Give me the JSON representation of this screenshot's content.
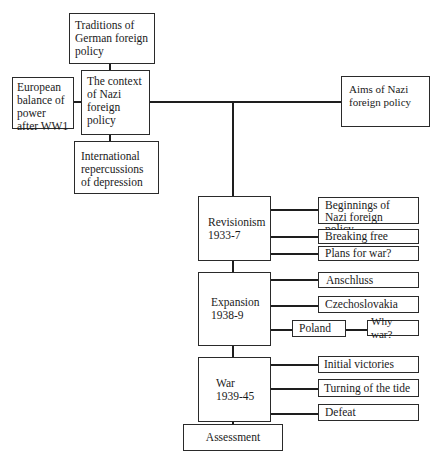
{
  "diagram": {
    "type": "hierarchy-chart",
    "context": {
      "center": "The context of Nazi foreign policy",
      "top": "Traditions of German foreign policy",
      "left": "European balance of power after WW1",
      "bottom": "International repercussions of depression"
    },
    "aims": "Aims of Nazi foreign policy",
    "phases": [
      {
        "title": "Revisionism",
        "years": "1933-7",
        "topics": [
          "Beginnings of Nazi foreign policy",
          "Breaking free",
          "Plans for war?"
        ]
      },
      {
        "title": "Expansion",
        "years": "1938-9",
        "topics": [
          "Anschluss",
          "Czechoslovakia",
          "Poland"
        ],
        "subtopic": "Why war?"
      },
      {
        "title": "War",
        "years": "1939-45",
        "topics": [
          "Initial victories",
          "Turning of the tide",
          "Defeat"
        ]
      }
    ],
    "conclusion": "Assessment"
  }
}
